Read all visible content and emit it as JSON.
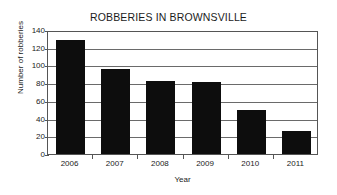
{
  "chart_data": {
    "type": "bar",
    "title": "ROBBERIES IN BROWNSVILLE",
    "xlabel": "Year",
    "ylabel": "Number of robberies",
    "categories": [
      "2006",
      "2007",
      "2008",
      "2009",
      "2010",
      "2011"
    ],
    "values": [
      129,
      96,
      83,
      81,
      50,
      26
    ],
    "series": [
      {
        "name": "Number of robberies",
        "values": [
          129,
          96,
          83,
          81,
          50,
          26
        ]
      }
    ],
    "ylim": [
      0,
      140
    ],
    "ytick_labels": [
      "0",
      "20",
      "40",
      "60",
      "80",
      "100",
      "120",
      "140"
    ],
    "ytick_values": [
      0,
      20,
      40,
      60,
      80,
      100,
      120,
      140
    ],
    "xtick_labels": [
      "2006",
      "2007",
      "2008",
      "2009",
      "2010",
      "2011"
    ],
    "grid": true,
    "grid_axis": "y",
    "legend": false,
    "bar_color": "#0d0d0d",
    "frame_color": "#555555",
    "background_color": "#ffffff"
  }
}
